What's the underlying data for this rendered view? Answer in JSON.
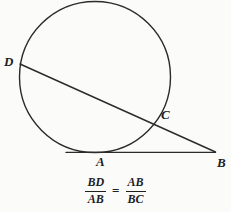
{
  "figure": {
    "type": "geometry-diagram",
    "background_color": "#fbfbfa",
    "stroke_color": "#2b2b2a",
    "points": [
      {
        "id": "D",
        "label": "D",
        "x": 20,
        "y": 64,
        "on": "circle"
      },
      {
        "id": "C",
        "label": "C",
        "x": 157,
        "y": 116,
        "on": "circle"
      },
      {
        "id": "A",
        "label": "A",
        "x": 100,
        "y": 152,
        "on": "circle-tangent-point"
      },
      {
        "id": "B",
        "label": "B",
        "x": 215,
        "y": 152,
        "on": "external"
      }
    ],
    "circle": {
      "cx": 95,
      "cy": 77,
      "r": 76
    },
    "segments": [
      {
        "id": "tangent-AB",
        "from": "A",
        "to": "B",
        "x1": 66,
        "y1": 152,
        "x2": 215,
        "y2": 152
      },
      {
        "id": "secant-DB",
        "from": "D",
        "to": "B",
        "x1": 20,
        "y1": 64,
        "x2": 215,
        "y2": 152
      }
    ]
  },
  "labels": {
    "D": "D",
    "C": "C",
    "A": "A",
    "B": "B"
  },
  "formula": {
    "left": {
      "numerator": "BD",
      "denominator": "AB"
    },
    "operator": "=",
    "right": {
      "numerator": "AB",
      "denominator": "BC"
    },
    "plain_text": "BD/AB = AB/BC"
  }
}
